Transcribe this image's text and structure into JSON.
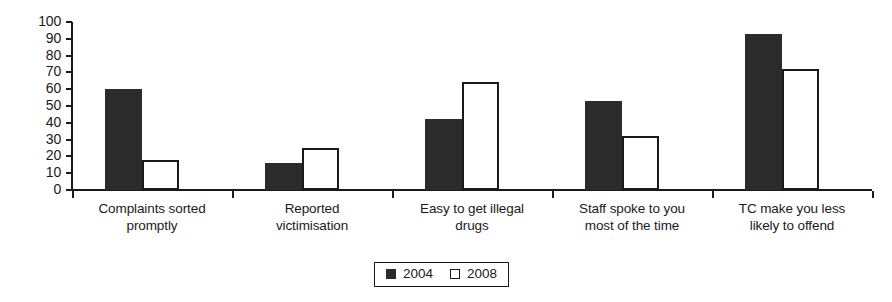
{
  "chart_data": {
    "type": "bar",
    "title": "",
    "xlabel": "",
    "ylabel": "",
    "ylim": [
      0,
      100
    ],
    "ytick_step": 10,
    "yticks": [
      100,
      90,
      80,
      70,
      60,
      50,
      40,
      30,
      20,
      10,
      0
    ],
    "grid": false,
    "legend_position": "bottom-center",
    "categories": [
      "Complaints sorted promptly",
      "Reported victimisation",
      "Easy to get illegal drugs",
      "Staff spoke to you most of the time",
      "TC make you less likely to offend"
    ],
    "category_lines": [
      [
        "Complaints sorted",
        "promptly"
      ],
      [
        "Reported",
        "victimisation"
      ],
      [
        "Easy to get illegal",
        "drugs"
      ],
      [
        "Staff spoke to you",
        "most of the time"
      ],
      [
        "TC make you less",
        "likely to offend"
      ]
    ],
    "series": [
      {
        "name": "2004",
        "color": "#2b2b2b",
        "style": "filled",
        "values": [
          60,
          16,
          42,
          53,
          93
        ]
      },
      {
        "name": "2008",
        "color": "#ffffff",
        "style": "outlined",
        "values": [
          18,
          25,
          64,
          32,
          72
        ]
      }
    ]
  },
  "legend": {
    "entries": [
      {
        "label": "2004",
        "swatch": "filled-square"
      },
      {
        "label": "2008",
        "swatch": "outlined-square"
      }
    ]
  },
  "colors": {
    "axis": "#1a1a1a",
    "series_2004": "#2b2b2b",
    "series_2008": "#ffffff",
    "background": "#ffffff"
  }
}
